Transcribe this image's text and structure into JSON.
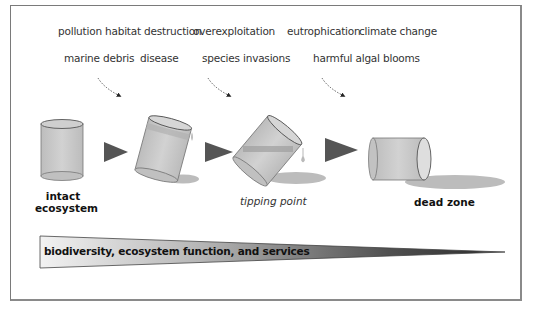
{
  "figure": {
    "stressors_row1": [
      "pollution",
      "habitat destruction",
      "overexploitation",
      "eutrophication",
      "climate change"
    ],
    "stressors_row2": [
      "marine debris",
      "disease",
      "species invasions",
      "harmful algal blooms"
    ],
    "stages": {
      "intact": "intact ecosystem",
      "intact_line1": "intact",
      "intact_line2": "ecosystem",
      "tipping": "tipping point",
      "dead": "dead zone"
    },
    "gradient_bar": {
      "label": "biodiversity, ecosystem function, and services",
      "color_start": "#f0f0f0",
      "color_end": "#3a3a3a"
    },
    "colors": {
      "cylinder_fill": "#c8c8c8",
      "cylinder_stroke": "#6a6a6a",
      "arrow_fill": "#555555",
      "spill": "#bdbdbd"
    }
  }
}
